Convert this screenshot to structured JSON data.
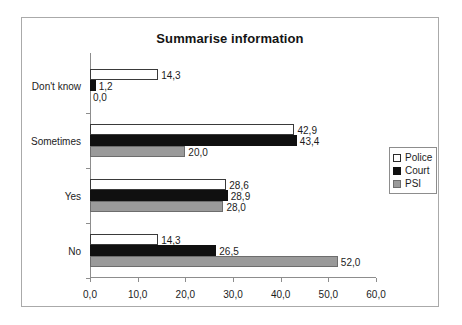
{
  "chart_data": {
    "type": "bar",
    "orientation": "horizontal",
    "title": "Summarise information",
    "xlabel": "",
    "ylabel": "",
    "categories": [
      "Don't know",
      "Sometimes",
      "Yes",
      "No"
    ],
    "series": [
      {
        "name": "Police",
        "color": "#ffffff",
        "values": [
          14.3,
          42.9,
          28.6,
          14.3
        ],
        "labels": [
          "14,3",
          "42,9",
          "28,6",
          "14,3"
        ]
      },
      {
        "name": "Court",
        "color": "#101010",
        "values": [
          1.2,
          43.4,
          28.9,
          26.5
        ],
        "labels": [
          "1,2",
          "43,4",
          "28,9",
          "26,5"
        ]
      },
      {
        "name": "PSI",
        "color": "#9a9a9a",
        "values": [
          0.0,
          20.0,
          28.0,
          52.0
        ],
        "labels": [
          "0,0",
          "20,0",
          "28,0",
          "52,0"
        ]
      }
    ],
    "xlim": [
      0,
      60
    ],
    "xticks": [
      0,
      10,
      20,
      30,
      40,
      50,
      60
    ],
    "xtick_labels": [
      "0,0",
      "10,0",
      "20,0",
      "30,0",
      "40,0",
      "50,0",
      "60,0"
    ],
    "grid": false,
    "legend_position": "right",
    "decimal_separator": ","
  },
  "legend": {
    "items": [
      {
        "label": "Police",
        "swatch": "police-swatch"
      },
      {
        "label": "Court",
        "swatch": "court-swatch"
      },
      {
        "label": "PSI",
        "swatch": "psi-swatch"
      }
    ]
  }
}
